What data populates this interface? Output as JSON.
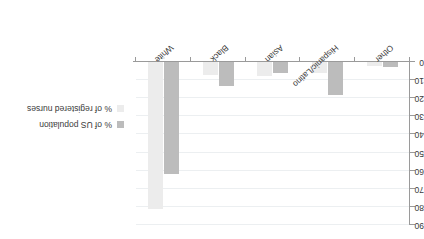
{
  "chart_data": {
    "type": "bar",
    "title": "",
    "subtitle": "",
    "xlabel": "",
    "ylabel": "",
    "orientation": "vertical-inverted",
    "rotation_degrees": 180,
    "grid": true,
    "legend_position": "left",
    "ylim": [
      0,
      90
    ],
    "yticks": [
      0,
      10,
      20,
      30,
      40,
      50,
      60,
      70,
      80,
      90
    ],
    "ytick_labels": [
      "0",
      "10",
      "20",
      "30",
      "40",
      "50",
      "60",
      "70",
      "80",
      "90"
    ],
    "y_axis_side": "right",
    "categories": [
      "Other",
      "Hispanic/Latino",
      "Asian",
      "Black",
      "White"
    ],
    "series": [
      {
        "name": "% of US population",
        "color": "#bcbcbc",
        "values": [
          3,
          18,
          6,
          13,
          62
        ]
      },
      {
        "name": "% of registered nurses",
        "color": "#ececec",
        "values": [
          2,
          6,
          8,
          7,
          81
        ]
      }
    ]
  },
  "axis": {
    "tick_labels": [
      "0",
      "10",
      "20",
      "30",
      "40",
      "50",
      "60",
      "70",
      "80",
      "90"
    ]
  },
  "categories": {
    "labels": [
      "Other",
      "Hispanic/Latino",
      "Asian",
      "Black",
      "White"
    ]
  },
  "legend": {
    "items": [
      {
        "label": "% of US population",
        "color": "#bcbcbc"
      },
      {
        "label": "% of registered nurses",
        "color": "#ececec"
      }
    ]
  }
}
